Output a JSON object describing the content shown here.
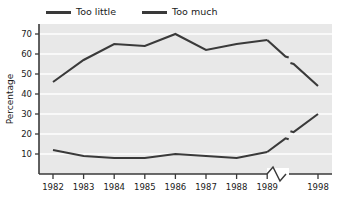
{
  "legend": {
    "position": "top-left",
    "entries": [
      {
        "label": "Too little",
        "color": "#3a3a3a",
        "swatch": "line-swatch"
      },
      {
        "label": "Too much",
        "color": "#3a3a3a",
        "swatch": "line-swatch"
      }
    ]
  },
  "axes": {
    "ylabel": "Percentage",
    "xlabel": "",
    "ylim": [
      0,
      75
    ],
    "yticks": [
      10,
      20,
      30,
      40,
      50,
      60,
      70
    ],
    "ytick_labels": [
      "10",
      "20",
      "30",
      "40",
      "50",
      "60",
      "70"
    ],
    "xtick_labels": [
      "1982",
      "1983",
      "1984",
      "1985",
      "1986",
      "1987",
      "1988",
      "1989",
      "1998"
    ],
    "axis_break": true,
    "axis_break_between": [
      "1989",
      "1998"
    ],
    "grid": "horizontal"
  },
  "chart_data": {
    "type": "line",
    "title": "",
    "xlabel": "",
    "ylabel": "Percentage",
    "ylim": [
      0,
      75
    ],
    "grid": true,
    "legend_position": "top-left",
    "axis_break_after": "1989",
    "categories": [
      "1982",
      "1983",
      "1984",
      "1985",
      "1986",
      "1987",
      "1988",
      "1989",
      "1998"
    ],
    "series": [
      {
        "name": "Too much",
        "color": "#3a3a3a",
        "values": [
          46,
          57,
          65,
          64,
          70,
          62,
          65,
          67,
          44
        ]
      },
      {
        "name": "Too little",
        "color": "#3a3a3a",
        "values": [
          12,
          9,
          8,
          8,
          10,
          9,
          8,
          11,
          30
        ]
      }
    ]
  },
  "colors": {
    "plot_background": "#e8e8e8",
    "gridline": "#ffffff",
    "axis": "#3a3a3a",
    "series": "#3a3a3a",
    "page_background": "#ffffff"
  }
}
